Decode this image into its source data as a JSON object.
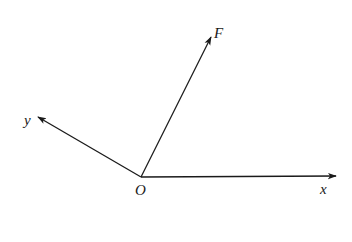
{
  "diagram": {
    "type": "force-vector-axes",
    "origin": {
      "label": "O",
      "x": 141,
      "y": 177
    },
    "axes": [
      {
        "name": "x",
        "label": "x",
        "tip": {
          "x": 336,
          "y": 176
        },
        "label_pos": {
          "x": 320,
          "y": 194
        }
      },
      {
        "name": "y",
        "label": "y",
        "tip": {
          "x": 38,
          "y": 117
        },
        "label_pos": {
          "x": 24,
          "y": 125
        }
      }
    ],
    "vectors": [
      {
        "name": "F",
        "label": "F",
        "tip": {
          "x": 211,
          "y": 37
        },
        "label_pos": {
          "x": 214,
          "y": 38
        }
      }
    ],
    "colors": {
      "line": "#1a1a1a",
      "background": "#ffffff"
    }
  }
}
